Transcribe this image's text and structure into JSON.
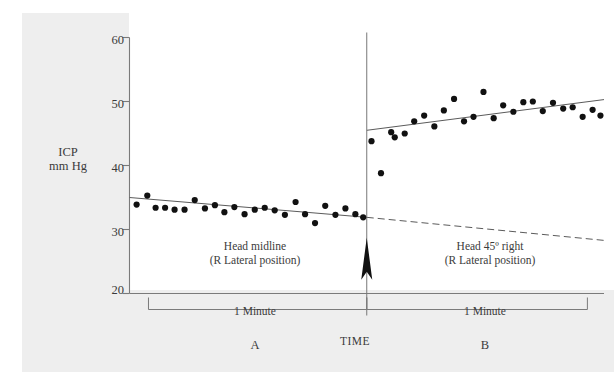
{
  "figure": {
    "background_color": "#eeeeee",
    "plot_background_color": "#ffffff",
    "ink_color": "#222222",
    "text_color": "#3b3b3b"
  },
  "axis": {
    "y_title_line1": "ICP",
    "y_title_line2": "mm Hg",
    "y_ticks": [
      "60",
      "50",
      "40",
      "30",
      "20"
    ],
    "x_title": "TIME"
  },
  "annotations": {
    "panel_a_caption_line1": "Head midline",
    "panel_a_caption_line2": "(R Lateral position)",
    "panel_b_caption_line1": "Head 45º right",
    "panel_b_caption_line2": "(R Lateral position)",
    "bracket_a_label": "1 Minute",
    "bracket_b_label": "1 Minute",
    "panel_a_letter": "A",
    "panel_b_letter": "B",
    "event_marker": "up-arrow"
  },
  "chart_data": {
    "type": "scatter",
    "title": "",
    "xlabel": "TIME",
    "ylabel": "ICP mm Hg",
    "ylim": [
      20,
      60
    ],
    "yticks": [
      20,
      30,
      40,
      50,
      60
    ],
    "xlim": [
      0,
      2
    ],
    "grid": false,
    "legend": null,
    "series": [
      {
        "name": "A — Head midline (R Lateral position)",
        "marker": "filled-circle",
        "color": "#111111",
        "x": [
          0.03,
          0.075,
          0.11,
          0.15,
          0.19,
          0.232,
          0.275,
          0.318,
          0.36,
          0.4,
          0.442,
          0.485,
          0.528,
          0.57,
          0.612,
          0.655,
          0.7,
          0.74,
          0.782,
          0.825,
          0.868,
          0.91,
          0.952,
          0.985
        ],
        "y": [
          33.9,
          35.3,
          33.4,
          33.4,
          33.1,
          33.1,
          34.6,
          33.3,
          33.8,
          32.7,
          33.5,
          32.4,
          33.1,
          33.4,
          33.0,
          32.3,
          34.3,
          32.4,
          31.0,
          33.7,
          32.3,
          33.3,
          32.4,
          31.9
        ]
      },
      {
        "name": "B — Head 45º right (R Lateral position)",
        "marker": "filled-circle",
        "color": "#111111",
        "x": [
          1.02,
          1.06,
          1.103,
          1.118,
          1.16,
          1.2,
          1.242,
          1.285,
          1.325,
          1.368,
          1.41,
          1.45,
          1.492,
          1.535,
          1.575,
          1.618,
          1.66,
          1.7,
          1.742,
          1.785,
          1.828,
          1.868,
          1.91,
          1.952,
          1.985
        ],
        "y": [
          43.8,
          38.8,
          45.2,
          44.4,
          45.0,
          46.9,
          47.8,
          46.1,
          48.6,
          50.4,
          46.9,
          47.6,
          51.5,
          47.4,
          49.4,
          48.4,
          49.9,
          50.0,
          48.5,
          49.8,
          48.9,
          49.1,
          47.6,
          48.7,
          47.8
        ]
      }
    ],
    "trendlines": [
      {
        "name": "regression-a",
        "style": "solid",
        "x": [
          0.0,
          1.0
        ],
        "y": [
          35.0,
          31.9
        ]
      },
      {
        "name": "regression-a-extrapolated",
        "style": "dashed",
        "x": [
          1.0,
          2.0
        ],
        "y": [
          31.9,
          28.3
        ]
      },
      {
        "name": "regression-b",
        "style": "solid",
        "x": [
          1.0,
          2.0
        ],
        "y": [
          45.5,
          50.3
        ]
      }
    ],
    "annotations": [
      {
        "type": "vline",
        "x": 1.0,
        "label": "position change"
      },
      {
        "type": "arrow",
        "x": 1.0,
        "y": 22.0,
        "direction": "up"
      }
    ]
  }
}
